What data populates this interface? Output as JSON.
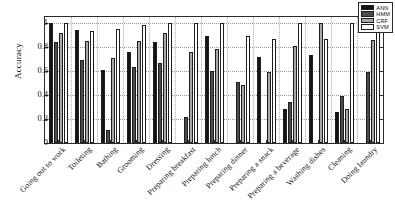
{
  "chart_data": {
    "type": "bar",
    "title": "",
    "subtitle": "",
    "xlabel": "",
    "ylabel": "Accuracy",
    "ylim": [
      0,
      1.05
    ],
    "yticks": [
      0,
      0.2,
      0.4,
      0.6,
      0.8,
      1
    ],
    "ytick_labels": [
      "0",
      "0.2",
      "0.4",
      "0.6",
      "0.8",
      "1"
    ],
    "grid": true,
    "grid_axis": "both",
    "legend_position": "top-right",
    "orientation": "vertical",
    "grouped": true,
    "categories": [
      "Going out to work",
      "Toileting",
      "Bathing",
      "Grooming",
      "Dressing",
      "Preparing breakfast",
      "Preparing lunch",
      "Preparing dinner",
      "Preparing a snack",
      "Preparing a beverage",
      "Washing dishes",
      "Cleaning",
      "Doing laundry"
    ],
    "series": [
      {
        "name": "ANN",
        "color": "#141414",
        "values": [
          1.0,
          0.94,
          0.61,
          0.76,
          0.84,
          0.0,
          0.89,
          0.0,
          0.72,
          0.28,
          0.73,
          0.26,
          0.0
        ]
      },
      {
        "name": "HMM",
        "color": "#4c4c4c",
        "values": [
          0.84,
          0.69,
          0.11,
          0.63,
          0.67,
          0.22,
          0.6,
          0.51,
          0.0,
          0.34,
          0.0,
          0.39,
          0.59
        ]
      },
      {
        "name": "CRF",
        "color": "#a8a8a8",
        "values": [
          0.92,
          0.85,
          0.71,
          0.85,
          0.92,
          0.76,
          0.78,
          0.48,
          0.59,
          0.81,
          1.0,
          0.28,
          0.86
        ]
      },
      {
        "name": "SVM",
        "color": "#ffffff",
        "values": [
          1.0,
          0.93,
          0.95,
          0.98,
          1.0,
          1.0,
          1.0,
          0.89,
          0.87,
          1.0,
          0.87,
          1.0,
          1.0
        ]
      }
    ]
  },
  "legend": {
    "entries": [
      {
        "label": "ANN"
      },
      {
        "label": "HMM"
      },
      {
        "label": "CRF"
      },
      {
        "label": "SVM"
      }
    ]
  },
  "axes": {
    "y_title": "Accuracy"
  }
}
